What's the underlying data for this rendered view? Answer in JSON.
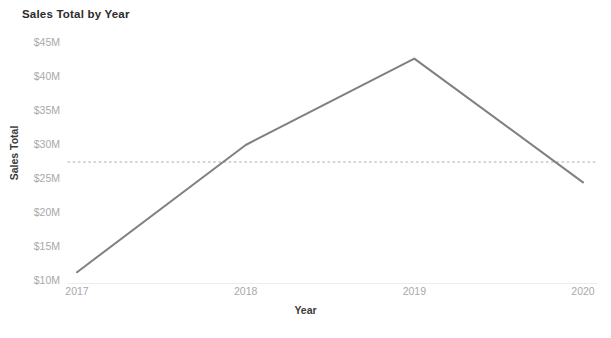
{
  "chart_data": {
    "type": "line",
    "title": "Sales Total by Year",
    "xlabel": "Year",
    "ylabel": "Sales Total",
    "categories": [
      "2017",
      "2018",
      "2019",
      "2020"
    ],
    "x": [
      2017,
      2018,
      2019,
      2020
    ],
    "values": [
      11.3,
      30.0,
      42.7,
      24.5
    ],
    "value_unit": "$M",
    "series": [
      {
        "name": "Sales Total",
        "values": [
          11.3,
          30.0,
          42.7,
          24.5
        ],
        "color": "#808080"
      }
    ],
    "ylim": [
      10,
      45
    ],
    "yticks": [
      10,
      15,
      20,
      25,
      30,
      35,
      40,
      45
    ],
    "ytick_labels": [
      "$10M",
      "$15M",
      "$20M",
      "$25M",
      "$30M",
      "$35M",
      "$40M",
      "$45M"
    ],
    "xtick_labels": [
      "2017",
      "2018",
      "2019",
      "2020"
    ],
    "grid": false,
    "legend": "none",
    "reference_line": {
      "name": "average-reference-line",
      "value": 27.5,
      "style": "dotted",
      "color": "#aaaaaa",
      "orientation": "horizontal"
    },
    "colors": {
      "line": "#808080",
      "tick_label": "#a9a9a9",
      "axis_title": "#3a3a3a",
      "title": "#2b2b2b",
      "background": "#ffffff",
      "reference_line": "#aaaaaa"
    }
  }
}
